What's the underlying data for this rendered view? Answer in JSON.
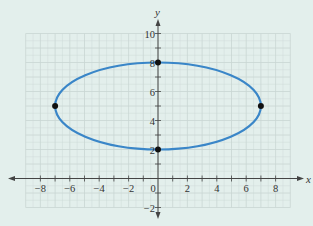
{
  "chart_data": {
    "type": "line",
    "title": "",
    "xlabel": "x",
    "ylabel": "y",
    "xlim": [
      -9,
      9
    ],
    "ylim": [
      -2,
      10
    ],
    "grid": true,
    "x_ticks": [
      -8,
      -6,
      -4,
      -2,
      0,
      2,
      4,
      6,
      8
    ],
    "y_ticks": [
      -2,
      2,
      4,
      6,
      8,
      10
    ],
    "x_tick_labels": [
      "−8",
      "−6",
      "−4",
      "−2",
      "0",
      "2",
      "4",
      "6",
      "8"
    ],
    "y_tick_labels": [
      "−2",
      "2",
      "4",
      "6",
      "8",
      "10"
    ],
    "series": [
      {
        "name": "ellipse",
        "shape": "ellipse",
        "center": [
          0,
          5
        ],
        "semi_axis_x": 7,
        "semi_axis_y": 3,
        "equation": "x^2/49 + (y-5)^2/9 = 1",
        "color": "#3a86c8"
      }
    ],
    "points": [
      {
        "x": -7,
        "y": 5
      },
      {
        "x": 7,
        "y": 5
      },
      {
        "x": 0,
        "y": 8
      },
      {
        "x": 0,
        "y": 2
      }
    ]
  },
  "colors": {
    "background": "#e3efec",
    "grid": "#c9d6d3",
    "axis": "#444444",
    "curve": "#3a86c8",
    "point": "#111111"
  }
}
